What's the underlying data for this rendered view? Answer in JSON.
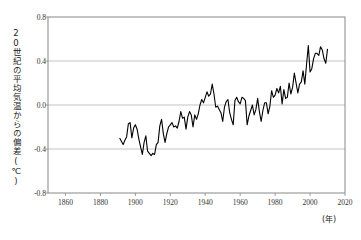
{
  "chart_data": {
    "type": "line",
    "title": "",
    "xlabel": "(年)",
    "ylabel": "20世紀の平均気温からの偏差(℃)",
    "xlim": [
      1850,
      2020
    ],
    "ylim": [
      -0.8,
      0.8
    ],
    "xticks": [
      1860,
      1880,
      1900,
      1920,
      1940,
      1960,
      1980,
      2000,
      2020
    ],
    "yticks": [
      0.8,
      0.4,
      0.0,
      -0.4,
      -0.8
    ],
    "xtick_labels": [
      "1860",
      "1880",
      "1900",
      "1920",
      "1940",
      "1960",
      "1980",
      "2000",
      "2020"
    ],
    "ytick_labels": [
      "0.8",
      "0.4",
      "0.0",
      "-0.4",
      "-0.8"
    ],
    "grid": "horizontal",
    "legend": "none",
    "series_color": "#000000",
    "grid_color": "#b4b4b4",
    "axis_color": "#808080",
    "series": [
      {
        "name": "気温偏差",
        "x": [
          1891,
          1892,
          1893,
          1894,
          1895,
          1896,
          1897,
          1898,
          1899,
          1900,
          1901,
          1902,
          1903,
          1904,
          1905,
          1906,
          1907,
          1908,
          1909,
          1910,
          1911,
          1912,
          1913,
          1914,
          1915,
          1916,
          1917,
          1918,
          1919,
          1920,
          1921,
          1922,
          1923,
          1924,
          1925,
          1926,
          1927,
          1928,
          1929,
          1930,
          1931,
          1932,
          1933,
          1934,
          1935,
          1936,
          1937,
          1938,
          1939,
          1940,
          1941,
          1942,
          1943,
          1944,
          1945,
          1946,
          1947,
          1948,
          1949,
          1950,
          1951,
          1952,
          1953,
          1954,
          1955,
          1956,
          1957,
          1958,
          1959,
          1960,
          1961,
          1962,
          1963,
          1964,
          1965,
          1966,
          1967,
          1968,
          1969,
          1970,
          1971,
          1972,
          1973,
          1974,
          1975,
          1976,
          1977,
          1978,
          1979,
          1980,
          1981,
          1982,
          1983,
          1984,
          1985,
          1986,
          1987,
          1988,
          1989,
          1990,
          1991,
          1992,
          1993,
          1994,
          1995,
          1996,
          1997,
          1998,
          1999,
          2000,
          2001,
          2002,
          2003,
          2004,
          2005,
          2006,
          2007,
          2008,
          2009,
          2010
        ],
        "y": [
          -0.3,
          -0.33,
          -0.36,
          -0.32,
          -0.29,
          -0.17,
          -0.16,
          -0.3,
          -0.21,
          -0.18,
          -0.22,
          -0.31,
          -0.38,
          -0.45,
          -0.34,
          -0.28,
          -0.42,
          -0.44,
          -0.46,
          -0.44,
          -0.45,
          -0.36,
          -0.34,
          -0.19,
          -0.13,
          -0.26,
          -0.34,
          -0.26,
          -0.2,
          -0.18,
          -0.16,
          -0.2,
          -0.19,
          -0.21,
          -0.15,
          -0.06,
          -0.12,
          -0.11,
          -0.22,
          -0.11,
          -0.06,
          -0.09,
          -0.2,
          -0.09,
          -0.13,
          -0.08,
          0.0,
          0.05,
          0.02,
          0.07,
          0.12,
          0.08,
          0.1,
          0.19,
          0.1,
          -0.02,
          -0.01,
          -0.04,
          -0.07,
          -0.15,
          -0.02,
          0.03,
          0.05,
          -0.07,
          -0.13,
          -0.18,
          0.04,
          0.07,
          0.03,
          0.01,
          0.07,
          0.06,
          0.04,
          -0.18,
          -0.1,
          -0.05,
          0.0,
          -0.09,
          -0.04,
          0.06,
          -0.06,
          -0.15,
          -0.05,
          0.02,
          0.02,
          -0.08,
          -0.01,
          0.13,
          0.07,
          0.09,
          0.15,
          0.11,
          0.17,
          0.01,
          0.14,
          0.06,
          0.07,
          0.2,
          0.1,
          0.16,
          0.29,
          0.2,
          0.11,
          0.19,
          0.21,
          0.31,
          0.19,
          0.37,
          0.54,
          0.3,
          0.33,
          0.42,
          0.47,
          0.47,
          0.45,
          0.53,
          0.5,
          0.42,
          0.38,
          0.51
        ]
      }
    ]
  },
  "axis": {
    "ylabel_text": "20世紀の平均気温からの偏差(℃)",
    "xunit_text": "(年)"
  }
}
